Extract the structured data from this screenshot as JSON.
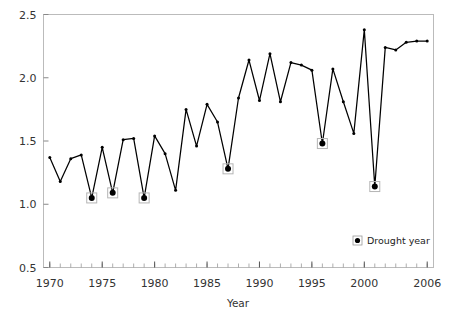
{
  "chart_data": {
    "type": "line",
    "title": "",
    "xlabel": "Year",
    "ylabel": "",
    "xlim": [
      1969.4,
      2006.6
    ],
    "ylim": [
      0.5,
      2.5
    ],
    "grid": false,
    "legend_position": "bottom-right",
    "x_tick_labels": [
      "1970",
      "1975",
      "1980",
      "1985",
      "1990",
      "1995",
      "2000",
      "2006"
    ],
    "x_tick_values": [
      1970,
      1975,
      1980,
      1985,
      1990,
      1995,
      2000,
      2006
    ],
    "y_tick_labels": [
      "0.5",
      "1.0",
      "1.5",
      "2.0",
      "2.5"
    ],
    "y_tick_values": [
      0.5,
      1.0,
      1.5,
      2.0,
      2.5
    ],
    "x": [
      1970,
      1971,
      1972,
      1973,
      1974,
      1975,
      1976,
      1977,
      1978,
      1979,
      1980,
      1981,
      1982,
      1983,
      1984,
      1985,
      1986,
      1987,
      1988,
      1989,
      1990,
      1991,
      1992,
      1993,
      1994,
      1995,
      1996,
      1997,
      1998,
      1999,
      2000,
      2001,
      2002,
      2003,
      2004,
      2005,
      2006
    ],
    "values": [
      1.37,
      1.18,
      1.36,
      1.39,
      1.05,
      1.45,
      1.09,
      1.51,
      1.52,
      1.05,
      1.54,
      1.4,
      1.11,
      1.75,
      1.46,
      1.79,
      1.65,
      1.28,
      1.84,
      2.14,
      1.82,
      2.19,
      1.81,
      2.12,
      2.1,
      2.06,
      1.48,
      2.07,
      1.81,
      1.56,
      2.38,
      1.14,
      2.24,
      2.22,
      2.28,
      2.29,
      2.29
    ],
    "series": [
      {
        "name": "Annual value",
        "values": [
          1.37,
          1.18,
          1.36,
          1.39,
          1.05,
          1.45,
          1.09,
          1.51,
          1.52,
          1.05,
          1.54,
          1.4,
          1.11,
          1.75,
          1.46,
          1.79,
          1.65,
          1.28,
          1.84,
          2.14,
          1.82,
          2.19,
          1.81,
          2.12,
          2.1,
          2.06,
          1.48,
          2.07,
          1.81,
          1.56,
          2.38,
          1.14,
          2.24,
          2.22,
          2.28,
          2.29,
          2.29
        ]
      }
    ],
    "drought_years": [
      1974,
      1976,
      1979,
      1987,
      1996,
      2001
    ],
    "legend": [
      {
        "label": "Drought year",
        "marker": "square-with-dot",
        "color": "#000000"
      }
    ],
    "line_color": "#000000",
    "marker_color": "#000000"
  },
  "legend": {
    "drought_label": "Drought year"
  },
  "axes": {
    "x_title": "Year"
  }
}
